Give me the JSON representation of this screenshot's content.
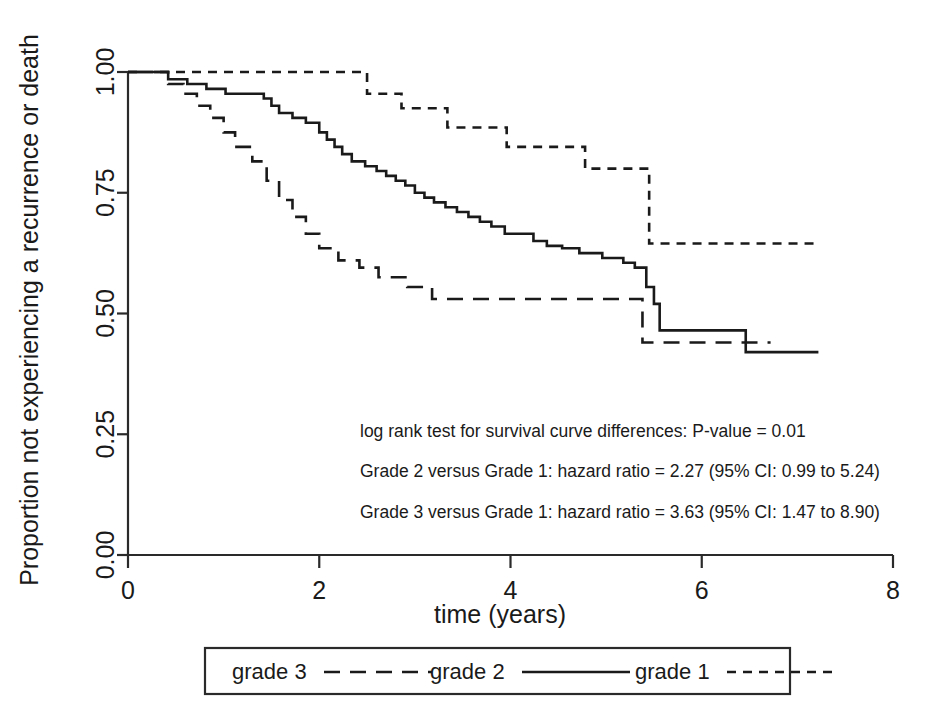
{
  "chart_data": {
    "type": "line",
    "title": "",
    "xlabel": "time (years)",
    "ylabel": "Proportion not experiencing a recurrence or death",
    "xlim": [
      0,
      8
    ],
    "ylim": [
      0,
      1
    ],
    "xticks": [
      "0",
      "2",
      "4",
      "6",
      "8"
    ],
    "xtick_values": [
      0,
      2,
      4,
      6,
      8
    ],
    "yticks": [
      "0.00",
      "0.25",
      "0.50",
      "0.75",
      "1.00"
    ],
    "ytick_values": [
      0,
      0.25,
      0.5,
      0.75,
      1
    ],
    "grid": false,
    "legend_position": "bottom",
    "series": [
      {
        "name": "grade 3",
        "style": "long-dash",
        "dasharray": "16 10",
        "points": [
          [
            0.0,
            1.0
          ],
          [
            0.42,
            1.0
          ],
          [
            0.42,
            0.975
          ],
          [
            0.58,
            0.975
          ],
          [
            0.58,
            0.955
          ],
          [
            0.72,
            0.955
          ],
          [
            0.72,
            0.93
          ],
          [
            0.86,
            0.93
          ],
          [
            0.86,
            0.905
          ],
          [
            1.0,
            0.905
          ],
          [
            1.0,
            0.875
          ],
          [
            1.12,
            0.875
          ],
          [
            1.12,
            0.845
          ],
          [
            1.3,
            0.845
          ],
          [
            1.3,
            0.815
          ],
          [
            1.45,
            0.815
          ],
          [
            1.45,
            0.775
          ],
          [
            1.58,
            0.775
          ],
          [
            1.58,
            0.735
          ],
          [
            1.72,
            0.735
          ],
          [
            1.72,
            0.7
          ],
          [
            1.86,
            0.7
          ],
          [
            1.86,
            0.665
          ],
          [
            2.0,
            0.665
          ],
          [
            2.0,
            0.635
          ],
          [
            2.2,
            0.635
          ],
          [
            2.2,
            0.61
          ],
          [
            2.42,
            0.61
          ],
          [
            2.42,
            0.595
          ],
          [
            2.62,
            0.595
          ],
          [
            2.62,
            0.575
          ],
          [
            2.92,
            0.575
          ],
          [
            2.92,
            0.555
          ],
          [
            3.18,
            0.555
          ],
          [
            3.18,
            0.53
          ],
          [
            5.38,
            0.53
          ],
          [
            5.38,
            0.44
          ],
          [
            6.72,
            0.44
          ]
        ]
      },
      {
        "name": "grade 2",
        "style": "solid",
        "dasharray": "",
        "points": [
          [
            0.0,
            1.0
          ],
          [
            0.42,
            1.0
          ],
          [
            0.42,
            0.985
          ],
          [
            0.62,
            0.985
          ],
          [
            0.62,
            0.975
          ],
          [
            0.82,
            0.975
          ],
          [
            0.82,
            0.965
          ],
          [
            1.02,
            0.965
          ],
          [
            1.02,
            0.955
          ],
          [
            1.42,
            0.955
          ],
          [
            1.42,
            0.945
          ],
          [
            1.5,
            0.945
          ],
          [
            1.5,
            0.93
          ],
          [
            1.58,
            0.93
          ],
          [
            1.58,
            0.915
          ],
          [
            1.72,
            0.915
          ],
          [
            1.72,
            0.905
          ],
          [
            1.86,
            0.905
          ],
          [
            1.86,
            0.895
          ],
          [
            2.0,
            0.895
          ],
          [
            2.0,
            0.875
          ],
          [
            2.08,
            0.875
          ],
          [
            2.08,
            0.86
          ],
          [
            2.16,
            0.86
          ],
          [
            2.16,
            0.845
          ],
          [
            2.24,
            0.845
          ],
          [
            2.24,
            0.83
          ],
          [
            2.34,
            0.83
          ],
          [
            2.34,
            0.815
          ],
          [
            2.48,
            0.815
          ],
          [
            2.48,
            0.805
          ],
          [
            2.6,
            0.805
          ],
          [
            2.6,
            0.795
          ],
          [
            2.7,
            0.795
          ],
          [
            2.7,
            0.785
          ],
          [
            2.8,
            0.785
          ],
          [
            2.8,
            0.775
          ],
          [
            2.9,
            0.775
          ],
          [
            2.9,
            0.765
          ],
          [
            3.0,
            0.765
          ],
          [
            3.0,
            0.75
          ],
          [
            3.1,
            0.75
          ],
          [
            3.1,
            0.74
          ],
          [
            3.2,
            0.74
          ],
          [
            3.2,
            0.73
          ],
          [
            3.32,
            0.73
          ],
          [
            3.32,
            0.72
          ],
          [
            3.44,
            0.72
          ],
          [
            3.44,
            0.71
          ],
          [
            3.56,
            0.71
          ],
          [
            3.56,
            0.7
          ],
          [
            3.68,
            0.7
          ],
          [
            3.68,
            0.69
          ],
          [
            3.8,
            0.69
          ],
          [
            3.8,
            0.68
          ],
          [
            3.94,
            0.68
          ],
          [
            3.94,
            0.665
          ],
          [
            4.24,
            0.665
          ],
          [
            4.24,
            0.65
          ],
          [
            4.38,
            0.65
          ],
          [
            4.38,
            0.64
          ],
          [
            4.54,
            0.64
          ],
          [
            4.54,
            0.635
          ],
          [
            4.72,
            0.635
          ],
          [
            4.72,
            0.625
          ],
          [
            4.96,
            0.625
          ],
          [
            4.96,
            0.615
          ],
          [
            5.18,
            0.615
          ],
          [
            5.18,
            0.605
          ],
          [
            5.3,
            0.605
          ],
          [
            5.3,
            0.595
          ],
          [
            5.42,
            0.595
          ],
          [
            5.42,
            0.555
          ],
          [
            5.5,
            0.555
          ],
          [
            5.5,
            0.52
          ],
          [
            5.56,
            0.52
          ],
          [
            5.56,
            0.465
          ],
          [
            6.46,
            0.465
          ],
          [
            6.46,
            0.42
          ],
          [
            7.22,
            0.42
          ]
        ]
      },
      {
        "name": "grade 1",
        "style": "short-dash",
        "dasharray": "9 7",
        "points": [
          [
            0.0,
            1.0
          ],
          [
            2.5,
            1.0
          ],
          [
            2.5,
            0.955
          ],
          [
            2.86,
            0.955
          ],
          [
            2.86,
            0.925
          ],
          [
            3.34,
            0.925
          ],
          [
            3.34,
            0.885
          ],
          [
            3.96,
            0.885
          ],
          [
            3.96,
            0.845
          ],
          [
            4.78,
            0.845
          ],
          [
            4.78,
            0.8
          ],
          [
            5.45,
            0.8
          ],
          [
            5.45,
            0.645
          ],
          [
            7.2,
            0.645
          ]
        ]
      }
    ],
    "annotations": [
      "log rank test for survival curve differences: P-value = 0.01",
      "Grade 2 versus Grade 1: hazard ratio = 2.27 (95% CI: 0.99 to 5.24)",
      "Grade 3 versus Grade 1: hazard ratio = 3.63 (95% CI: 1.47 to 8.90)"
    ],
    "legend": [
      {
        "label": "grade 3",
        "style": "long-dash"
      },
      {
        "label": "grade 2",
        "style": "solid"
      },
      {
        "label": "grade 1",
        "style": "short-dash"
      }
    ],
    "colors": {
      "line": "#1a1a1a",
      "axis": "#2a2a2a",
      "background": "#ffffff"
    }
  }
}
